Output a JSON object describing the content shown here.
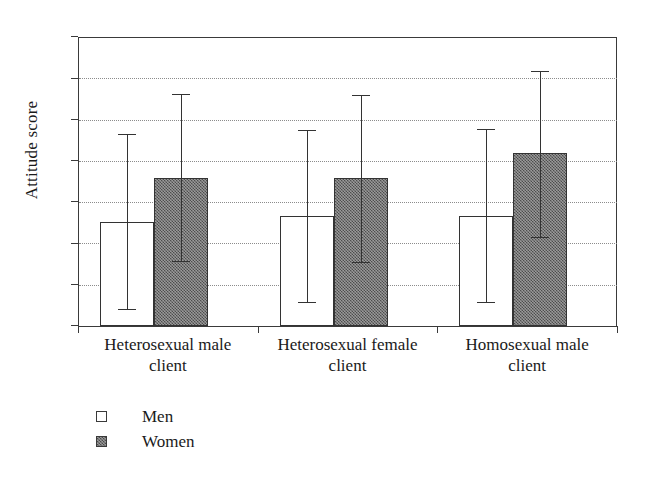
{
  "chart_data": {
    "type": "bar",
    "title": "",
    "xlabel": "",
    "ylabel": "Attitude score",
    "ylim": [
      0,
      7
    ],
    "ytick_labels": [
      "0",
      "1",
      "2",
      "3",
      "4",
      "5",
      "6",
      "7"
    ],
    "grid": true,
    "grid_style": "dotted horizontal",
    "legend_position": "below-left",
    "categories": [
      "Heterosexual male client",
      "Heterosexual female client",
      "Homosexual male client"
    ],
    "category_lines": [
      [
        "Heterosexual male",
        "client"
      ],
      [
        "Heterosexual female",
        "client"
      ],
      [
        "Homosexual male",
        "client"
      ]
    ],
    "series": [
      {
        "name": "Men",
        "fill": "#ffffff",
        "values": [
          2.52,
          2.66,
          2.66
        ],
        "error_upper": [
          4.64,
          4.74,
          4.76
        ],
        "error_lower": [
          0.4,
          0.57,
          0.58
        ]
      },
      {
        "name": "Women",
        "fill": "#6f6f6f",
        "values": [
          3.58,
          3.58,
          4.2
        ],
        "error_upper": [
          5.62,
          5.6,
          6.18
        ],
        "error_lower": [
          1.57,
          1.56,
          2.16
        ]
      }
    ]
  },
  "legend": {
    "items": [
      {
        "label": "Men",
        "swatch": "white-square"
      },
      {
        "label": "Women",
        "swatch": "gray-square"
      }
    ]
  },
  "axes": {
    "y_title": "Attitude score"
  },
  "colors": {
    "axis": "#3a3a3a",
    "grid": "#8c8c8c",
    "men_fill": "#ffffff",
    "women_fill": "#6f6f6f",
    "text": "#1a1a1a"
  }
}
